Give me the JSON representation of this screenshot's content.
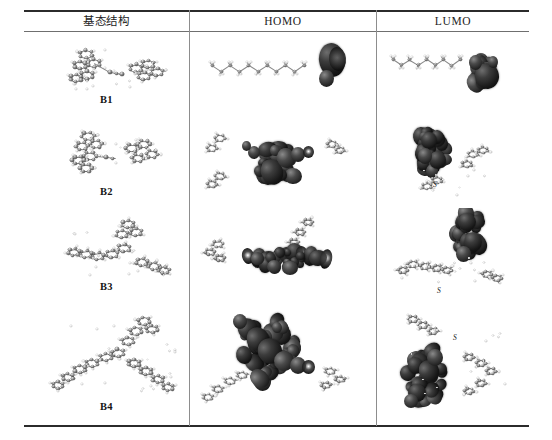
{
  "figure": {
    "type": "molecular-orbital-table",
    "columns": [
      {
        "key": "structure",
        "label": "基态结构"
      },
      {
        "key": "homo",
        "label": "HOMO"
      },
      {
        "key": "lumo",
        "label": "LUMO"
      }
    ],
    "rows": [
      {
        "label": "B1",
        "structure": {
          "caption": "B1",
          "description": "ball-and-stick ground state geometry, two aromatic units joined by a short linker"
        },
        "homo": {
          "description": "extended alkyl/conjugated backbone with dense orbital lobes localized on the terminal group at the right"
        },
        "lumo": {
          "description": "chain backbone with one large dark isosurface blob localized on the terminal acceptor at the right"
        }
      },
      {
        "label": "B2",
        "structure": {
          "caption": "B2",
          "description": "ball-and-stick ground state geometry, bent two-armed molecule"
        },
        "homo": {
          "description": "orbital density delocalized over the central donor core and the adjacent ring"
        },
        "lumo": {
          "description": "orbital density concentrated as a dense cluster on the upper-left acceptor ring",
          "atom_labels": [
            "S"
          ]
        }
      },
      {
        "label": "B3",
        "structure": {
          "caption": "B3",
          "description": "ball-and-stick ground state geometry, three-armed star-shaped molecule"
        },
        "homo": {
          "description": "horizontal band of orbital lobes spread along the central conjugated bridge"
        },
        "lumo": {
          "description": "orbital density localized on the vertical acceptor arm at the top-center",
          "atom_labels": [
            "S"
          ]
        }
      },
      {
        "label": "B4",
        "structure": {
          "caption": "B4",
          "description": "ball-and-stick ground state geometry, large Y-shaped three-armed molecule"
        },
        "homo": {
          "description": "extensive delocalization across the diagonal backbone spanning two arms"
        },
        "lumo": {
          "description": "orbital density localized on the lower-left acceptor arm",
          "atom_labels": [
            "S"
          ]
        }
      }
    ]
  },
  "style": {
    "rule_color": "#2b2b2b",
    "divider_color": "#8d8d8d",
    "background": "#ffffff",
    "orbital_color": "#101010",
    "carbon_color": "#6a6a6a",
    "hydrogen_color": "#e4e4e4"
  }
}
